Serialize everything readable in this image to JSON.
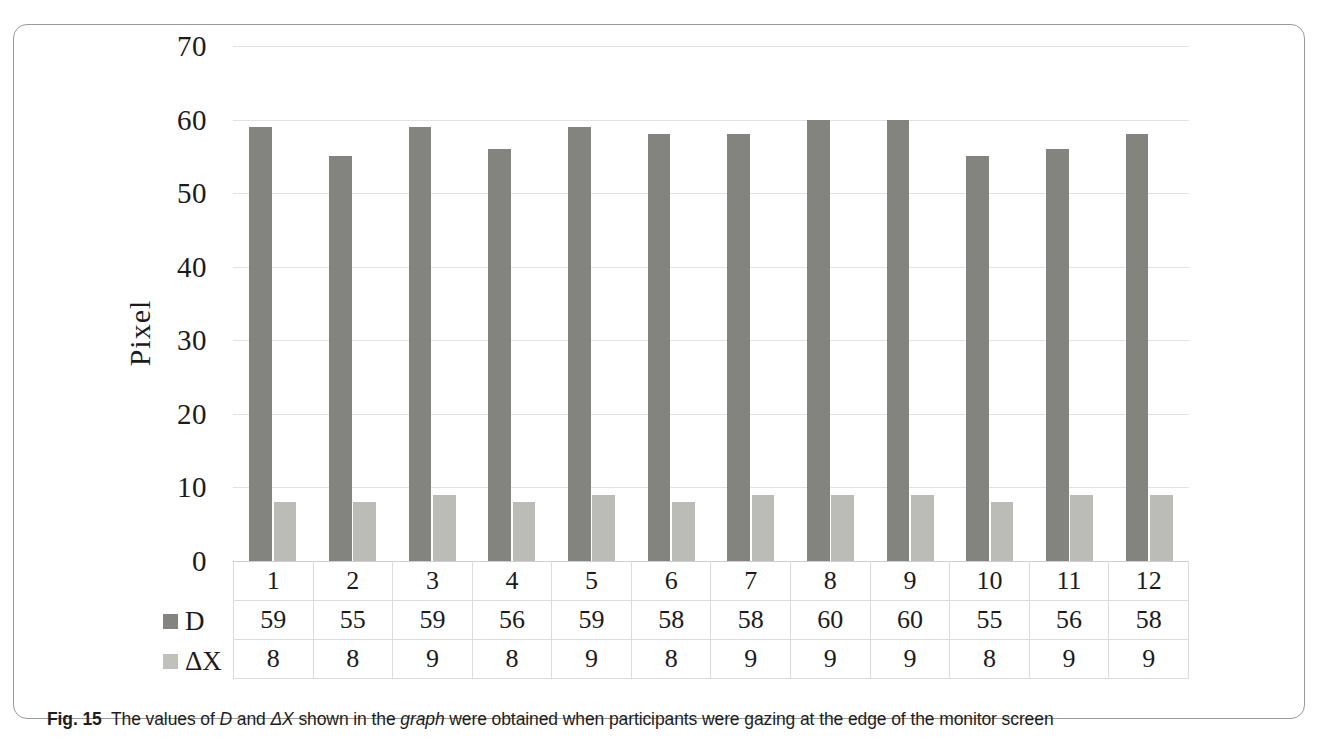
{
  "figure": {
    "caption_label": "Fig. 15",
    "caption_part1": "The values of ",
    "caption_em1": "D",
    "caption_part2": " and ",
    "caption_em2": "ΔX",
    "caption_part3": " shown in the ",
    "caption_em3": "graph",
    "caption_part4": " were obtained when participants were gazing at the edge of the monitor screen"
  },
  "chart_data": {
    "type": "bar",
    "title": "",
    "xlabel": "",
    "ylabel": "Pixel",
    "ylim": [
      0,
      70
    ],
    "ytick_step": 10,
    "yticks": [
      "70",
      "60",
      "50",
      "40",
      "30",
      "20",
      "10",
      "0"
    ],
    "ytick_values": [
      70,
      60,
      50,
      40,
      30,
      20,
      10,
      0
    ],
    "grid": true,
    "legend_position": "table-row-headers",
    "categories": [
      "1",
      "2",
      "3",
      "4",
      "5",
      "6",
      "7",
      "8",
      "9",
      "10",
      "11",
      "12"
    ],
    "series": [
      {
        "name": "D",
        "color": "#83837f",
        "values": [
          59,
          55,
          59,
          56,
          59,
          58,
          58,
          60,
          60,
          55,
          56,
          58
        ]
      },
      {
        "name": "ΔX",
        "color": "#bbbbb8",
        "values": [
          8,
          8,
          9,
          8,
          9,
          8,
          9,
          9,
          9,
          8,
          9,
          9
        ]
      }
    ]
  }
}
